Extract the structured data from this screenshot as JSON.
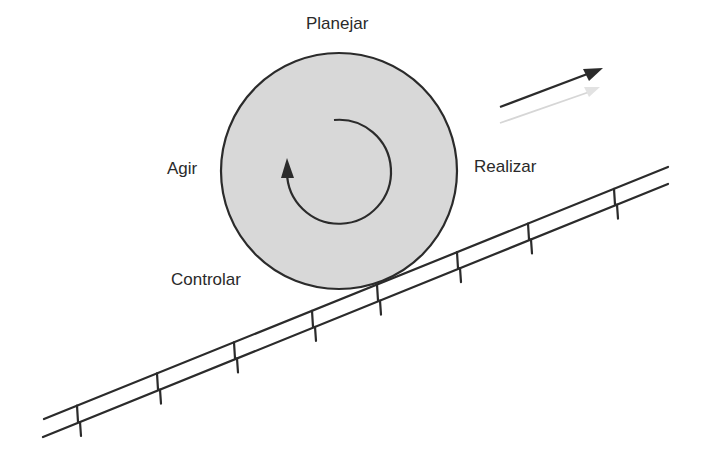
{
  "diagram": {
    "labels": {
      "top": "Planejar",
      "right": "Realizar",
      "left": "Agir",
      "bottom_left": "Controlar"
    },
    "colors": {
      "wheel_fill": "#d8d8d8",
      "stroke": "#2b2b2b",
      "faint_arrow": "#d6d6d6",
      "text": "#2a2a2a"
    },
    "wheel": {
      "cx": 339,
      "cy": 171,
      "r": 118
    },
    "inner_arrow": "clockwise-circular-arrow",
    "direction_arrow": "up-right-arrow",
    "ramp": {
      "upper_line": [
        [
          44,
          419
        ],
        [
          668,
          167
        ]
      ],
      "lower_line": [
        [
          43,
          437
        ],
        [
          668,
          184
        ]
      ],
      "tick_x": [
        77,
        157,
        234,
        312,
        377,
        457,
        528,
        614
      ]
    }
  }
}
